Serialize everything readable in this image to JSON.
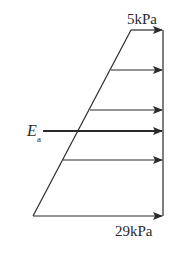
{
  "diagram": {
    "colors": {
      "line": "#2a2a2a",
      "background": "#ffffff"
    },
    "labels": {
      "top_pressure": "5kPa",
      "bottom_pressure": "29kPa",
      "resultant_main": "E",
      "resultant_sub": "a"
    },
    "geometry": {
      "wall_x": 163,
      "top_y": 30,
      "bottom_y": 216,
      "top_left_x": 131,
      "bottom_left_x": 33
    },
    "arrows": [
      {
        "name": "pressure-arrow-top",
        "y": 30,
        "x_start": 131
      },
      {
        "name": "pressure-arrow-2",
        "y": 70,
        "x_start": 111
      },
      {
        "name": "pressure-arrow-3",
        "y": 110,
        "x_start": 90
      },
      {
        "name": "resultant-arrow-ea",
        "y": 131,
        "x_start": 43
      },
      {
        "name": "pressure-arrow-4",
        "y": 160,
        "x_start": 63
      },
      {
        "name": "pressure-arrow-bottom",
        "y": 216,
        "x_start": 33
      }
    ]
  }
}
